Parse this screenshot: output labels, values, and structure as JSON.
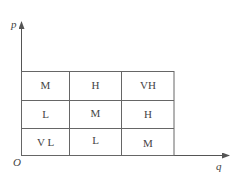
{
  "axes": {
    "y_label": "p",
    "x_label": "q",
    "origin_label": "O"
  },
  "grid": {
    "rows": [
      [
        "M",
        "H",
        "VH"
      ],
      [
        "L",
        "M",
        "H"
      ],
      [
        "V L",
        "L",
        "M"
      ]
    ]
  },
  "colors": {
    "line": "#555555",
    "text": "#444444"
  }
}
